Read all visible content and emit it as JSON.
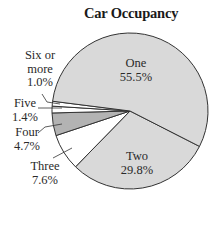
{
  "chart_data": {
    "type": "pie",
    "title": "Car Occupancy",
    "categories": [
      "One",
      "Two",
      "Three",
      "Four",
      "Five",
      "Six or more"
    ],
    "values": [
      55.5,
      29.8,
      7.6,
      4.7,
      1.4,
      1.0
    ],
    "value_labels": [
      "55.5%",
      "29.8%",
      "7.6%",
      "4.7%",
      "1.4%",
      "1.0%"
    ],
    "unit": "%",
    "slice_colors": {
      "One": "#d9d9d9",
      "Two": "#d9d9d9",
      "Three": "#ffffff",
      "Four": "#b3b3b3",
      "Five": "#ffffff",
      "Six or more": "#ffffff"
    },
    "legend": "none (direct labels with leader lines for small slices)",
    "start_angle_deg_clockwise_from_east": 27
  },
  "labels": {
    "title": "Car Occupancy",
    "one": {
      "name": "One",
      "pct": "55.5%"
    },
    "two": {
      "name": "Two",
      "pct": "29.8%"
    },
    "three": {
      "name": "Three",
      "pct": "7.6%"
    },
    "four": {
      "name": "Four",
      "pct": "4.7%"
    },
    "five": {
      "name": "Five",
      "pct": "1.4%"
    },
    "six": {
      "name_line1": "Six or",
      "name_line2": "more",
      "pct": "1.0%"
    }
  }
}
